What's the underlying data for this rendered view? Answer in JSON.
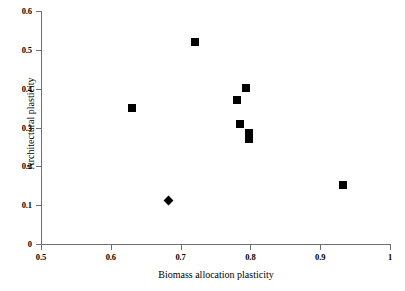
{
  "chart_data": {
    "type": "scatter",
    "title": "",
    "xlabel": "Biomass allocation plasticity",
    "ylabel": "Architectural plasticity",
    "xlim": [
      0.5,
      1
    ],
    "ylim": [
      0,
      0.6
    ],
    "grid": false,
    "legend": "none",
    "xticks": [
      "0.5",
      "0.6",
      "0.7",
      "0.8",
      "0.9",
      "1"
    ],
    "xtick_values": [
      0.5,
      0.6,
      0.7,
      0.8,
      0.9,
      1.0
    ],
    "yticks": [
      "0",
      "0.1",
      "0.2",
      "0.3",
      "0.4",
      "0.5",
      "0.6"
    ],
    "ytick_values": [
      0,
      0.1,
      0.2,
      0.3,
      0.4,
      0.5,
      0.6
    ],
    "series": [
      {
        "name": "squares",
        "marker": "square",
        "color": "#000000",
        "points": [
          {
            "x": 0.63,
            "y": 0.351
          },
          {
            "x": 0.72,
            "y": 0.521
          },
          {
            "x": 0.781,
            "y": 0.372
          },
          {
            "x": 0.794,
            "y": 0.402
          },
          {
            "x": 0.785,
            "y": 0.31
          },
          {
            "x": 0.798,
            "y": 0.286
          },
          {
            "x": 0.798,
            "y": 0.27
          },
          {
            "x": 0.933,
            "y": 0.152
          }
        ]
      },
      {
        "name": "diamond",
        "marker": "diamond",
        "color": "#000000",
        "points": [
          {
            "x": 0.682,
            "y": 0.111
          }
        ]
      }
    ]
  },
  "axis_color": "#6f6f6f"
}
